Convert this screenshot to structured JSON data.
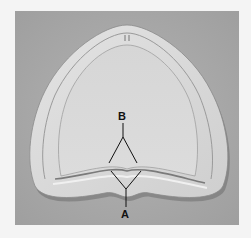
{
  "figure": {
    "colors": {
      "page_bg": "#f4f4f4",
      "photo_bg": "#a9a9a9",
      "cast": "#d9d9d9",
      "cast_inner": "#d2d2d2",
      "shadow": "#6e6e6e",
      "line": "#111111"
    },
    "labels": [
      {
        "id": "B",
        "text": "B"
      },
      {
        "id": "A",
        "text": "A"
      }
    ]
  }
}
